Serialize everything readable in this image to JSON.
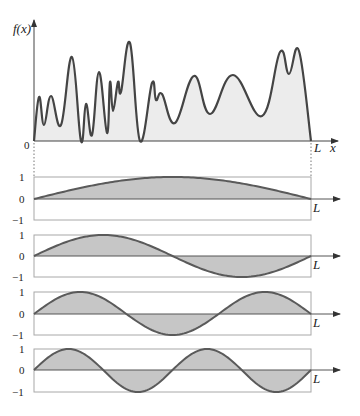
{
  "figure": {
    "top_plot": {
      "y_label": "f(x)",
      "x_label": "x",
      "origin_label": "0",
      "end_label": "L",
      "curve_points": [
        [
          34,
          141
        ],
        [
          39,
          97
        ],
        [
          44,
          125
        ],
        [
          51,
          96
        ],
        [
          61,
          125
        ],
        [
          72,
          57
        ],
        [
          81,
          141
        ],
        [
          86,
          104
        ],
        [
          92,
          135
        ],
        [
          99,
          72
        ],
        [
          107,
          133
        ],
        [
          110,
          82
        ],
        [
          113,
          111
        ],
        [
          118,
          82
        ],
        [
          121,
          92
        ],
        [
          130,
          43
        ],
        [
          140,
          141
        ],
        [
          152,
          83
        ],
        [
          156,
          100
        ],
        [
          162,
          94
        ],
        [
          175,
          123
        ],
        [
          194,
          76
        ],
        [
          210,
          114
        ],
        [
          233,
          75
        ],
        [
          262,
          116
        ],
        [
          280,
          52
        ],
        [
          289,
          74
        ],
        [
          299,
          51
        ],
        [
          311,
          141
        ]
      ],
      "fill_color": "#ececec",
      "stroke_color": "#444444"
    },
    "mode_panels": [
      {
        "mode": 1,
        "half_periods": 1,
        "tick_top": "1",
        "tick_zero": "0",
        "tick_bottom": "−1",
        "end_label": "L",
        "top_y": 177,
        "zero_y": 199,
        "bottom_y": 220
      },
      {
        "mode": 2,
        "half_periods": 2,
        "tick_top": "1",
        "tick_zero": "0",
        "tick_bottom": "−1",
        "end_label": "L",
        "top_y": 235,
        "zero_y": 256,
        "bottom_y": 277
      },
      {
        "mode": 3,
        "half_periods": 3,
        "tick_top": "1",
        "tick_zero": "0",
        "tick_bottom": "−1",
        "end_label": "L",
        "top_y": 292,
        "zero_y": 314,
        "bottom_y": 335
      },
      {
        "mode": 4,
        "half_periods": 4,
        "tick_top": "1",
        "tick_zero": "0",
        "tick_bottom": "−1",
        "end_label": "L",
        "top_y": 349,
        "zero_y": 370,
        "bottom_y": 392
      }
    ],
    "colors": {
      "mode_fill": "#c6c6c6",
      "mode_stroke": "#5a5a5a",
      "box_stroke": "#a8a8a8",
      "axis": "#555555"
    },
    "geometry": {
      "x0": 34,
      "xL": 311,
      "arrow_end": 340
    }
  }
}
